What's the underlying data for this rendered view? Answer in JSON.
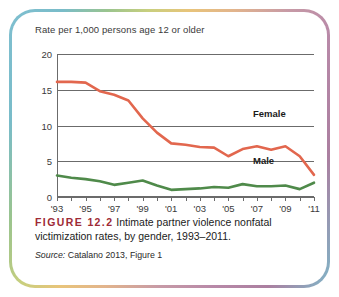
{
  "figure": {
    "label": "FIGURE 12.2",
    "caption": "Intimate partner violence nonfatal victimization rates, by gender, 1993–2011.",
    "source_word": "Source:",
    "source_text": "Catalano 2013, Figure 1"
  },
  "colors": {
    "female_line": "#e2674e",
    "male_line": "#4f8a4a",
    "gridline": "#6b6b6b",
    "figure_label": "#9e2b36",
    "frame_teal": "#7fbfd0",
    "frame_mauve": "#b889a8"
  },
  "chart_data": {
    "type": "line",
    "title": "Rate per 1,000 persons age 12 or older",
    "xlabel": "",
    "ylabel": "Rate per 1,000 persons age 12 or older",
    "ylim": [
      0,
      20
    ],
    "yticks": [
      0,
      5,
      10,
      15,
      20
    ],
    "ytick_labels": [
      "0",
      "5",
      "10",
      "15",
      "20"
    ],
    "grid": true,
    "legend_position": "inline-right",
    "x": [
      1993,
      1994,
      1995,
      1996,
      1997,
      1998,
      1999,
      2000,
      2001,
      2002,
      2003,
      2004,
      2005,
      2006,
      2007,
      2008,
      2009,
      2010,
      2011
    ],
    "xtick_labels": [
      "'93",
      "",
      "'95",
      "",
      "'97",
      "",
      "'99",
      "",
      "'01",
      "",
      "'03",
      "",
      "'05",
      "",
      "'07",
      "",
      "'09",
      "",
      "'11"
    ],
    "xtick_labeled_years": [
      "'93",
      "'95",
      "'97",
      "'99",
      "'01",
      "'03",
      "'05",
      "'07",
      "'09",
      "'11"
    ],
    "series": [
      {
        "name": "Female",
        "color": "#e2674e",
        "values": [
          16.1,
          16.1,
          16.0,
          14.8,
          14.3,
          13.5,
          11.0,
          9.0,
          7.5,
          7.3,
          7.0,
          6.9,
          5.7,
          6.7,
          7.1,
          6.6,
          7.1,
          5.7,
          3.1
        ]
      },
      {
        "name": "Male",
        "color": "#4f8a4a",
        "values": [
          3.0,
          2.7,
          2.5,
          2.2,
          1.7,
          2.0,
          2.3,
          1.6,
          1.0,
          1.1,
          1.2,
          1.4,
          1.3,
          1.8,
          1.5,
          1.5,
          1.6,
          1.1,
          2.0
        ]
      }
    ],
    "annotations": [
      {
        "text": "Female",
        "bold": true
      },
      {
        "text": "Male",
        "bold": true
      }
    ]
  }
}
